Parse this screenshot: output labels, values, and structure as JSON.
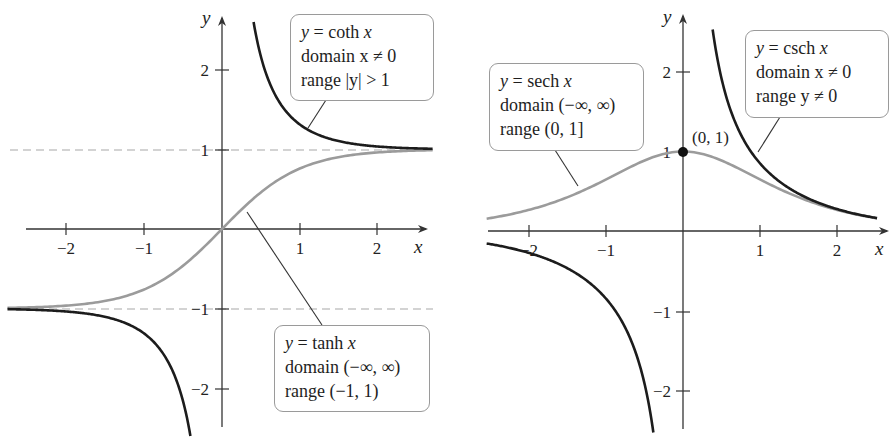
{
  "colors": {
    "dark_curve": "#1c1c1c",
    "gray_curve": "#9b9b9b",
    "axis": "#333333",
    "asymptote": "#a8a8a8"
  },
  "chart_data": [
    {
      "type": "line",
      "title": "Hyperbolic tangent and cotangent",
      "xlabel": "x",
      "ylabel": "y",
      "xlim": [
        -2.75,
        2.7
      ],
      "ylim": [
        -2.5,
        2.5
      ],
      "x_ticks": [
        -2,
        -1,
        1,
        2
      ],
      "x_tick_labels": [
        "−2",
        "−1",
        "1",
        "2"
      ],
      "y_ticks": [
        2,
        1,
        -1,
        -2
      ],
      "y_tick_labels": [
        "2",
        "1",
        "−1",
        "−2"
      ],
      "grid": false,
      "asymptotes": [
        {
          "y": 1,
          "style": "dashed"
        },
        {
          "y": -1,
          "style": "dashed"
        }
      ],
      "series": [
        {
          "name": "y = coth x",
          "function": "coth",
          "color": "dark",
          "domain": "x ≠ 0",
          "range": "|y| > 1",
          "x": [
            -2.75,
            -2,
            -1.5,
            -1,
            -0.75,
            -0.5,
            -0.42,
            0.42,
            0.5,
            0.75,
            1,
            1.5,
            2,
            2.7
          ],
          "values": [
            -1.008,
            -1.037,
            -1.105,
            -1.313,
            -1.572,
            -2.164,
            -2.53,
            2.53,
            2.164,
            1.572,
            1.313,
            1.105,
            1.037,
            1.009
          ]
        },
        {
          "name": "y = tanh x",
          "function": "tanh",
          "color": "gray",
          "domain": "(−∞, ∞)",
          "range": "(−1, 1)",
          "x": [
            -2.75,
            -2,
            -1.5,
            -1,
            -0.5,
            0,
            0.5,
            1,
            1.5,
            2,
            2.7
          ],
          "values": [
            -0.992,
            -0.964,
            -0.905,
            -0.762,
            -0.462,
            0,
            0.462,
            0.762,
            0.905,
            0.964,
            0.991
          ]
        }
      ]
    },
    {
      "type": "line",
      "title": "Hyperbolic secant and cosecant",
      "xlabel": "x",
      "ylabel": "y",
      "xlim": [
        -2.55,
        2.6
      ],
      "ylim": [
        -2.5,
        2.5
      ],
      "x_ticks": [
        -2,
        -1,
        1,
        2
      ],
      "x_tick_labels": [
        "−2",
        "−1",
        "1",
        "2"
      ],
      "y_ticks": [
        2,
        1,
        -1,
        -2
      ],
      "y_tick_labels": [
        "2",
        "1",
        "−1",
        "−2"
      ],
      "grid": false,
      "annotations": [
        {
          "text": "(0, 1)",
          "x": 0,
          "y": 1,
          "marker": "filled-circle"
        }
      ],
      "series": [
        {
          "name": "y = sech x",
          "function": "sech",
          "color": "gray",
          "domain": "(−∞, ∞)",
          "range": "(0, 1]",
          "x": [
            -2.55,
            -2,
            -1.5,
            -1,
            -0.5,
            0,
            0.5,
            1,
            1.5,
            2,
            2.5
          ],
          "values": [
            0.155,
            0.266,
            0.425,
            0.648,
            0.887,
            1,
            0.887,
            0.648,
            0.425,
            0.266,
            0.163
          ]
        },
        {
          "name": "y = csch x",
          "function": "csch",
          "color": "dark",
          "domain": "x ≠ 0",
          "range": "y ≠ 0",
          "x": [
            -2.55,
            -2,
            -1.5,
            -1,
            -0.75,
            -0.5,
            -0.39,
            0.39,
            0.5,
            0.75,
            1,
            1.5,
            2,
            2.5
          ],
          "values": [
            -0.157,
            -0.276,
            -0.47,
            -0.851,
            -1.218,
            -1.919,
            -2.53,
            2.53,
            1.919,
            1.218,
            0.851,
            0.47,
            0.276,
            0.165
          ]
        }
      ]
    }
  ],
  "left_chart": {
    "y_axis_label": "y",
    "x_axis_label": "x",
    "coth_label": {
      "lines": [
        "y = coth x",
        "domain x ≠ 0",
        "range |y| > 1"
      ]
    },
    "tanh_label": {
      "lines": [
        "y = tanh x",
        "domain (−∞, ∞)",
        "range (−1, 1)"
      ]
    },
    "x_tick_labels": [
      "−2",
      "−1",
      "1",
      "2"
    ],
    "y_tick_labels": [
      "2",
      "1",
      "−1",
      "−2"
    ]
  },
  "right_chart": {
    "y_axis_label": "y",
    "x_axis_label": "x",
    "sech_label": {
      "lines": [
        "y = sech x",
        "domain (−∞, ∞)",
        "range (0, 1]"
      ]
    },
    "csch_label": {
      "lines": [
        "y = csch x",
        "domain x ≠ 0",
        "range y ≠ 0"
      ]
    },
    "point_label": "(0, 1)",
    "x_tick_labels": [
      "−2",
      "−1",
      "1",
      "2"
    ],
    "y_tick_labels": [
      "2",
      "1",
      "−1",
      "−2"
    ]
  }
}
